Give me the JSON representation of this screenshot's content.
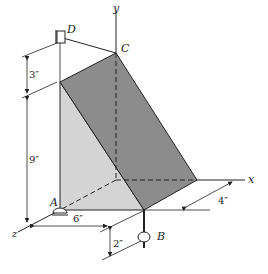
{
  "figure": {
    "points": {
      "A": "A",
      "B": "B",
      "C": "C",
      "D": "D"
    },
    "axes": {
      "x": "x",
      "y": "y",
      "z": "z"
    },
    "dimensions": {
      "d_3": "3″",
      "d_9": "9″",
      "d_6": "6″",
      "d_4": "4″",
      "d_2": "2″"
    },
    "colors": {
      "dark_face": "#8c8c8c",
      "light_face": "#d4d4d4",
      "line": "#222222"
    }
  }
}
